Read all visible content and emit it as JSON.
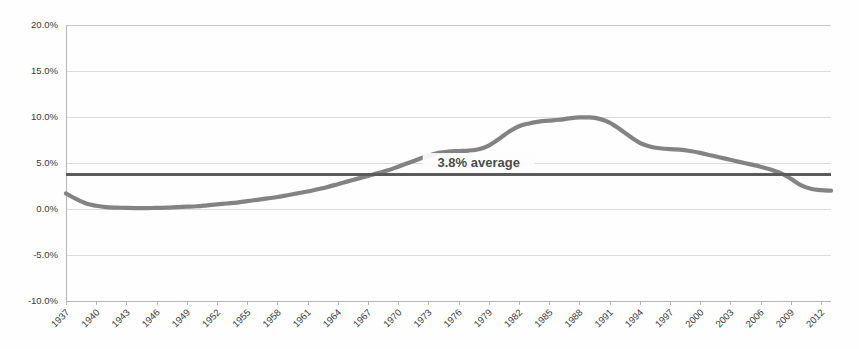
{
  "chart_data": {
    "type": "line",
    "title": "",
    "subtitle": "",
    "xlabel": "",
    "ylabel": "",
    "grid": true,
    "legend_position": "none",
    "ylim": [
      -10,
      20
    ],
    "ytick_labels": [
      "20.0%",
      "15.0%",
      "10.0%",
      "5.0%",
      "0.0%",
      "-5.0%",
      "-10.0%"
    ],
    "ytick_values": [
      20,
      15,
      10,
      5,
      0,
      -5,
      -10
    ],
    "xtick_labels": [
      "1937",
      "1940",
      "1943",
      "1946",
      "1949",
      "1952",
      "1955",
      "1958",
      "1961",
      "1964",
      "1967",
      "1970",
      "1973",
      "1976",
      "1979",
      "1982",
      "1985",
      "1988",
      "1991",
      "1994",
      "1997",
      "2000",
      "2003",
      "2006",
      "2009",
      "2012"
    ],
    "xlim": [
      1937,
      2013
    ],
    "series": [
      {
        "name": "rate",
        "color": "#838383",
        "x": [
          1937,
          1938,
          1939,
          1940,
          1941,
          1942,
          1943,
          1944,
          1945,
          1946,
          1947,
          1948,
          1949,
          1950,
          1951,
          1952,
          1953,
          1954,
          1955,
          1956,
          1957,
          1958,
          1959,
          1960,
          1961,
          1962,
          1963,
          1964,
          1965,
          1966,
          1967,
          1968,
          1969,
          1970,
          1971,
          1972,
          1973,
          1974,
          1975,
          1976,
          1977,
          1978,
          1979,
          1980,
          1981,
          1982,
          1983,
          1984,
          1985,
          1986,
          1987,
          1988,
          1989,
          1990,
          1991,
          1992,
          1993,
          1994,
          1995,
          1996,
          1997,
          1998,
          1999,
          2000,
          2001,
          2002,
          2003,
          2004,
          2005,
          2006,
          2007,
          2008,
          2009,
          2010,
          2011,
          2012,
          2013
        ],
        "y": [
          1.7,
          1.1,
          0.6,
          0.35,
          0.2,
          0.15,
          0.12,
          0.1,
          0.1,
          0.12,
          0.15,
          0.2,
          0.25,
          0.3,
          0.4,
          0.5,
          0.6,
          0.7,
          0.85,
          1.0,
          1.15,
          1.3,
          1.5,
          1.7,
          1.9,
          2.15,
          2.4,
          2.7,
          3.0,
          3.3,
          3.6,
          3.9,
          4.2,
          4.6,
          5.0,
          5.4,
          5.8,
          6.1,
          6.25,
          6.3,
          6.35,
          6.5,
          6.9,
          7.6,
          8.4,
          9.0,
          9.3,
          9.5,
          9.6,
          9.7,
          9.85,
          9.95,
          9.95,
          9.8,
          9.4,
          8.7,
          7.9,
          7.2,
          6.8,
          6.6,
          6.5,
          6.45,
          6.3,
          6.1,
          5.85,
          5.6,
          5.35,
          5.1,
          4.85,
          4.6,
          4.3,
          3.9,
          3.3,
          2.6,
          2.2,
          2.05,
          2.0
        ]
      }
    ],
    "reference_line": {
      "label": "3.8% average",
      "value": 3.8,
      "color": "#5b5b5b",
      "annotation_x": 1978
    }
  }
}
